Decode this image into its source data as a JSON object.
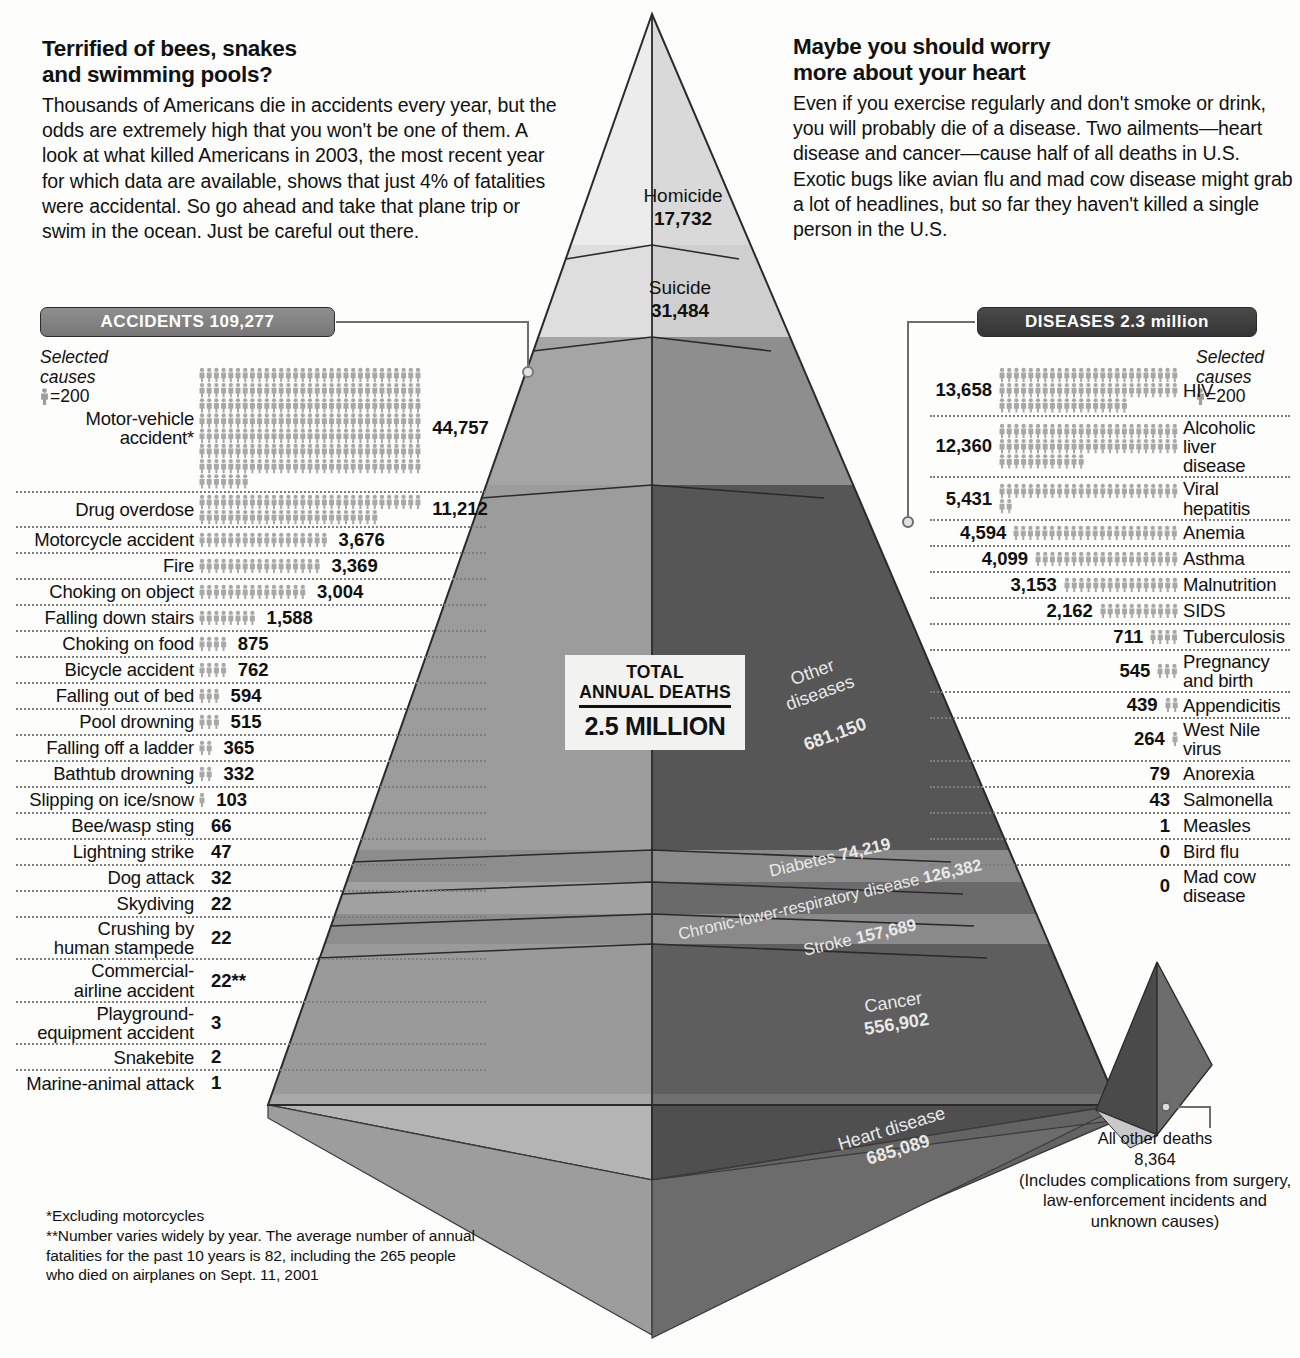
{
  "intro_left": {
    "heading": "Terrified of bees, snakes\nand swimming pools?",
    "body": "Thousands of Americans die in accidents every year, but the odds are extremely high that you won't be one of them. A look at what killed Americans in 2003,  the most recent year for which data are available, shows that just 4% of fatalities were accidental. So go ahead and take that plane trip or swim in the ocean. Just be careful out there."
  },
  "intro_right": {
    "heading": "Maybe you should worry\nmore about your heart",
    "body": "Even if you exercise regularly and don't smoke or drink, you will probably die of a disease. Two ailments—heart disease and cancer—cause half of all deaths in U.S. Exotic bugs like avian flu and mad cow disease might grab a lot of headlines, but so far they haven't killed a single person in the U.S."
  },
  "banners": {
    "accidents": "ACCIDENTS 109,277",
    "diseases": "DISEASES 2.3 million"
  },
  "legend": {
    "selected": "Selected",
    "causes": "causes",
    "scale": "=200",
    "icon": "person-icon"
  },
  "total": {
    "line1": "TOTAL",
    "line2": "ANNUAL DEATHS",
    "value": "2.5 MILLION"
  },
  "footnotes": {
    "one": "*Excluding motorcycles",
    "two": "**Number varies widely by year. The average number of annual fatalities for the past 10 years is 82,  including the 265 people who died on airplanes on Sept. 11, 2001"
  },
  "all_other": {
    "title": "All other deaths",
    "value": "8,364",
    "note": "(Includes complications from surgery, law-enforcement incidents and unknown causes)"
  },
  "chart_data": {
    "type": "pie",
    "title": "What killed Americans in 2003",
    "unit_per_icon": 200,
    "total_annual_deaths": 2500000,
    "pyramid_bands": [
      {
        "label": "Homicide",
        "value": 17732,
        "display": "17,732",
        "tone": "lightest"
      },
      {
        "label": "Suicide",
        "value": 31484,
        "display": "31,484",
        "tone": "lighter"
      },
      {
        "label": "Accidents",
        "value": 109277,
        "display": "109,277",
        "tone": "mid"
      },
      {
        "label": "Other\ndiseases",
        "value": 681150,
        "display": "681,150",
        "tone": "dark"
      },
      {
        "label": "Diabetes",
        "value": 74219,
        "display": "74,219",
        "tone": "band-light"
      },
      {
        "label": "Chronic-lower-respiratory disease",
        "value": 126382,
        "display": "126,382",
        "tone": "band-mid"
      },
      {
        "label": "Stroke",
        "value": 157689,
        "display": "157,689",
        "tone": "band-light"
      },
      {
        "label": "Cancer",
        "value": 556902,
        "display": "556,902",
        "tone": "dark"
      },
      {
        "label": "Heart disease",
        "value": 685089,
        "display": "685,089",
        "tone": "mid"
      }
    ],
    "accidents_total": 109277,
    "diseases_total": "2.3 million",
    "accidents": [
      {
        "label": "Motor-vehicle\naccident*",
        "value": 44757,
        "display": "44,757"
      },
      {
        "label": "Drug overdose",
        "value": 11212,
        "display": "11,212"
      },
      {
        "label": "Motorcycle accident",
        "value": 3676,
        "display": "3,676"
      },
      {
        "label": "Fire",
        "value": 3369,
        "display": "3,369"
      },
      {
        "label": "Choking on object",
        "value": 3004,
        "display": "3,004"
      },
      {
        "label": "Falling down stairs",
        "value": 1588,
        "display": "1,588"
      },
      {
        "label": "Choking on food",
        "value": 875,
        "display": "875"
      },
      {
        "label": "Bicycle accident",
        "value": 762,
        "display": "762"
      },
      {
        "label": "Falling out of bed",
        "value": 594,
        "display": "594"
      },
      {
        "label": "Pool drowning",
        "value": 515,
        "display": "515"
      },
      {
        "label": "Falling off a ladder",
        "value": 365,
        "display": "365"
      },
      {
        "label": "Bathtub drowning",
        "value": 332,
        "display": "332"
      },
      {
        "label": "Slipping on ice/snow",
        "value": 103,
        "display": "103"
      },
      {
        "label": "Bee/wasp sting",
        "value": 66,
        "display": "66"
      },
      {
        "label": "Lightning strike",
        "value": 47,
        "display": "47"
      },
      {
        "label": "Dog attack",
        "value": 32,
        "display": "32"
      },
      {
        "label": "Skydiving",
        "value": 22,
        "display": "22"
      },
      {
        "label": "Crushing by\nhuman stampede",
        "value": 22,
        "display": "22"
      },
      {
        "label": "Commercial-\nairline accident",
        "value": 22,
        "display": "22**"
      },
      {
        "label": "Playground-\nequipment accident",
        "value": 3,
        "display": "3"
      },
      {
        "label": "Snakebite",
        "value": 2,
        "display": "2"
      },
      {
        "label": "Marine-animal attack",
        "value": 1,
        "display": "1"
      }
    ],
    "diseases": [
      {
        "label": "HIV",
        "value": 13658,
        "display": "13,658"
      },
      {
        "label": "Alcoholic\nliver\ndisease",
        "value": 12360,
        "display": "12,360"
      },
      {
        "label": "Viral\nhepatitis",
        "value": 5431,
        "display": "5,431"
      },
      {
        "label": "Anemia",
        "value": 4594,
        "display": "4,594"
      },
      {
        "label": "Asthma",
        "value": 4099,
        "display": "4,099"
      },
      {
        "label": "Malnutrition",
        "value": 3153,
        "display": "3,153"
      },
      {
        "label": "SIDS",
        "value": 2162,
        "display": "2,162"
      },
      {
        "label": "Tuberculosis",
        "value": 711,
        "display": "711"
      },
      {
        "label": "Pregnancy\nand birth",
        "value": 545,
        "display": "545"
      },
      {
        "label": "Appendicitis",
        "value": 439,
        "display": "439"
      },
      {
        "label": "West Nile\nvirus",
        "value": 264,
        "display": "264"
      },
      {
        "label": "Anorexia",
        "value": 79,
        "display": "79"
      },
      {
        "label": "Salmonella",
        "value": 43,
        "display": "43"
      },
      {
        "label": "Measles",
        "value": 1,
        "display": "1"
      },
      {
        "label": "Bird flu",
        "value": 0,
        "display": "0"
      },
      {
        "label": "Mad cow\ndisease",
        "value": 0,
        "display": "0"
      }
    ],
    "all_other_deaths": 8364
  },
  "colors": {
    "lightest": "#e3e3e3",
    "lighter": "#d6d6d6",
    "mid": "#a3a3a3",
    "band_light": "#9b9b9b",
    "band_mid": "#6f6f6f",
    "dark": "#585858",
    "darkest": "#4e4e4e",
    "figure": "#a8a8a8",
    "dotted": "#7d7d7d"
  }
}
